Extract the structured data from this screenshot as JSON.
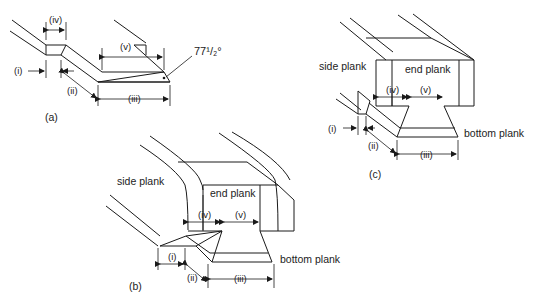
{
  "figure": {
    "panels": [
      {
        "id": "a",
        "caption": "(a)",
        "dimensions": [
          "(i)",
          "(ii)",
          "(iii)",
          "(iv)",
          "(v)"
        ],
        "angle_label": "77¹/₂°"
      },
      {
        "id": "b",
        "caption": "(b)",
        "dimensions": [
          "(i)",
          "(ii)",
          "(iii)",
          "(iv)",
          "(v)"
        ],
        "labels": {
          "side": "side plank",
          "end": "end plank",
          "bottom": "bottom plank"
        }
      },
      {
        "id": "c",
        "caption": "(c)",
        "dimensions": [
          "(i)",
          "(ii)",
          "(iii)",
          "(iv)",
          "(v)"
        ],
        "labels": {
          "side": "side plank",
          "end": "end plank",
          "bottom": "bottom plank"
        }
      }
    ]
  }
}
